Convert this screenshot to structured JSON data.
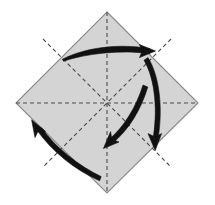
{
  "figure": {
    "title": "Origami fold diagram",
    "description": "Square sheet shown as a diamond with dashed crease lines and four curved fold arrows",
    "canvas": {
      "width": 215,
      "height": 205
    },
    "background_color": "#ffffff"
  },
  "paper": {
    "name": "square-sheet",
    "fill_color": "#d4d4d4",
    "edge_color": "#8c8c8c",
    "edge_width": 1.2,
    "corners": {
      "top": [
        107,
        12
      ],
      "right": [
        198,
        103
      ],
      "bottom": [
        107,
        193
      ],
      "left": [
        16,
        103
      ]
    }
  },
  "creases": {
    "color": "#4a4a4a",
    "width": 1.1,
    "dash": "4 3",
    "lines": [
      {
        "name": "crease-vertical",
        "from": [
          107,
          12
        ],
        "to": [
          107,
          193
        ]
      },
      {
        "name": "crease-horizontal",
        "from": [
          16,
          103
        ],
        "to": [
          198,
          103
        ]
      },
      {
        "name": "crease-diagonal-nw-se",
        "from": [
          43,
          39
        ],
        "to": [
          171,
          167
        ]
      },
      {
        "name": "crease-diagonal-ne-sw",
        "from": [
          171,
          39
        ],
        "to": [
          43,
          167
        ]
      }
    ]
  },
  "arrows": {
    "color": "#111111",
    "items": [
      {
        "name": "arrow-top-sweep-right",
        "direction": "right",
        "start": [
          62,
          59
        ],
        "end": [
          152,
          53
        ],
        "head_at": [
          152,
          53
        ]
      },
      {
        "name": "arrow-right-sweep-down",
        "direction": "down",
        "start": [
          148,
          57
        ],
        "end": [
          156,
          147
        ],
        "head_at": [
          156,
          147
        ]
      },
      {
        "name": "arrow-center-sweep-downleft",
        "direction": "down-left",
        "start": [
          148,
          88
        ],
        "end": [
          106,
          148
        ],
        "head_at": [
          106,
          148
        ]
      },
      {
        "name": "arrow-bottom-sweep-upleft",
        "direction": "up-left",
        "start": [
          101,
          176
        ],
        "end": [
          33,
          121
        ],
        "head_at": [
          33,
          121
        ]
      }
    ]
  }
}
